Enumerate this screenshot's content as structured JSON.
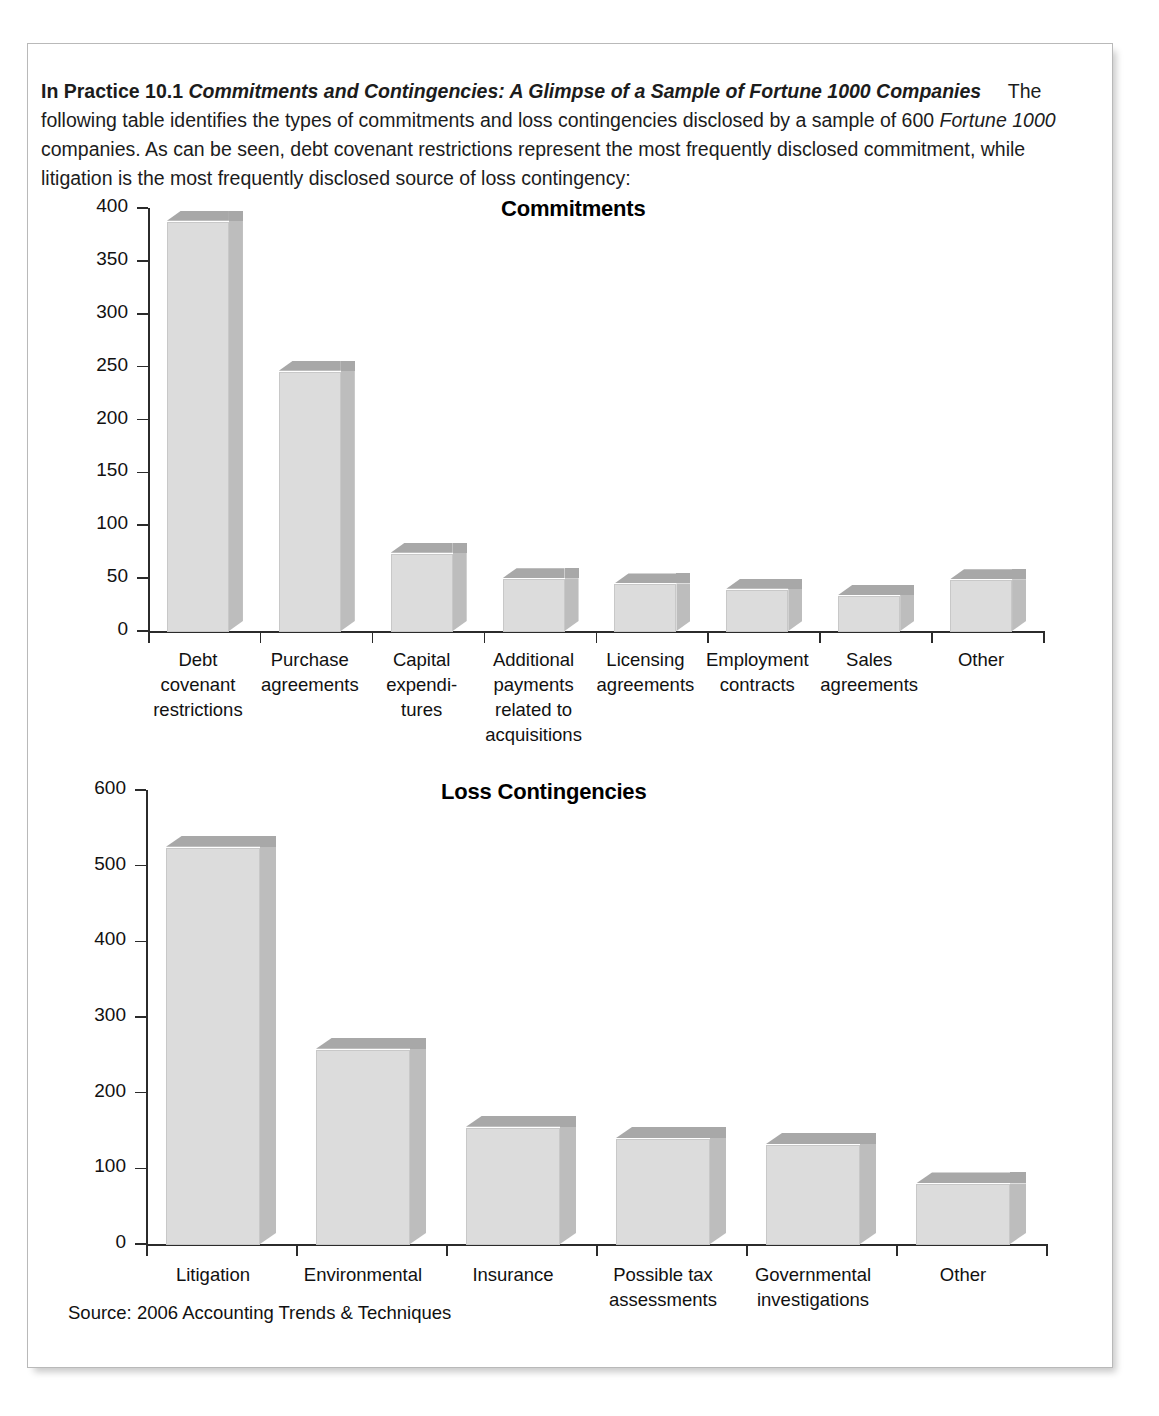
{
  "panel": {
    "intro": {
      "label": "In Practice 10.1",
      "title": "Commitments and Contingencies: A Glimpse of a Sample of Fortune 1000 Companies",
      "body_part1": "The following table identifies the types of commitments and loss contingencies disclosed by a sample of 600 ",
      "body_italic1": "Fortune 1000",
      "body_part2": " companies. As can be seen, debt covenant restrictions represent the most frequently disclosed commitment, while litigation is the most frequently disclosed source of loss contingency:"
    },
    "source": "Source: 2006 Accounting Trends & Techniques"
  },
  "chart_data": [
    {
      "type": "bar",
      "title": "Commitments",
      "xlabel": "",
      "ylabel": "",
      "ylim": [
        0,
        400
      ],
      "yticks": [
        0,
        50,
        100,
        150,
        200,
        250,
        300,
        350,
        400
      ],
      "grid": false,
      "legend": false,
      "categories": [
        "Debt\ncovenant\nrestrictions",
        "Purchase\nagreements",
        "Capital\nexpendi-\ntures",
        "Additional\npayments\nrelated to\nacquisitions",
        "Licensing\nagreements",
        "Employment\ncontracts",
        "Sales\nagreements",
        "Other"
      ],
      "values": [
        388,
        246,
        74,
        50,
        45,
        40,
        34,
        49
      ]
    },
    {
      "type": "bar",
      "title": "Loss Contingencies",
      "xlabel": "",
      "ylabel": "",
      "ylim": [
        0,
        600
      ],
      "yticks": [
        0,
        100,
        200,
        300,
        400,
        500,
        600
      ],
      "grid": false,
      "legend": false,
      "categories": [
        "Litigation",
        "Environmental",
        "Insurance",
        "Possible tax\nassessments",
        "Governmental\ninvestigations",
        "Other"
      ],
      "values": [
        525,
        258,
        155,
        140,
        132,
        80
      ]
    }
  ],
  "colors": {
    "bar_face": "#dcdcdc",
    "bar_top": "#a8a8a8",
    "bar_side": "#bdbdbd",
    "axis": "#2b2b2b",
    "panel_border": "#b9b9b9"
  }
}
